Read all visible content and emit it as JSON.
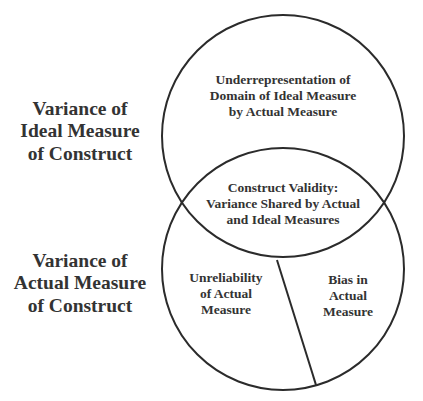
{
  "diagram": {
    "colors": {
      "stroke": "#2b2b2b",
      "text": "#333333",
      "background": "#ffffff"
    },
    "left_labels": {
      "ideal": [
        "Variance of",
        "Ideal Measure",
        "of Construct"
      ],
      "actual": [
        "Variance of",
        "Actual Measure",
        "of Construct"
      ]
    },
    "regions": {
      "underrepresentation": [
        "Underrepresentation of",
        "Domain of Ideal Measure",
        "by Actual Measure"
      ],
      "construct_validity": [
        "Construct Validity:",
        "Variance Shared by Actual",
        "and Ideal Measures"
      ],
      "unreliability": [
        "Unreliability",
        "of Actual",
        "Measure"
      ],
      "bias": [
        "Bias in",
        "Actual",
        "Measure"
      ]
    },
    "shapes": {
      "ideal_circle": {
        "cx": 283,
        "cy": 136,
        "r": 121
      },
      "actual_circle": {
        "cx": 283,
        "cy": 269,
        "r": 121
      },
      "divider": {
        "x1": 277,
        "y1": 260,
        "x2": 316,
        "y2": 385
      }
    }
  }
}
